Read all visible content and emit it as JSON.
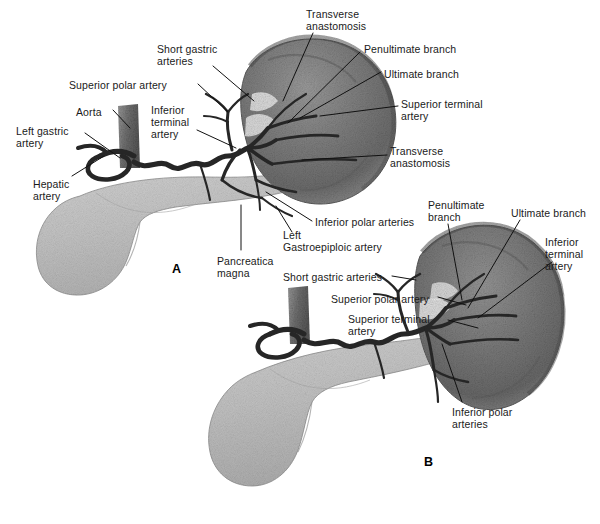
{
  "figure": {
    "background_color": "#ffffff",
    "label_color": "#1a1a1a",
    "organ_colors": {
      "spleen_dark": "#6f6f6f",
      "spleen_mid": "#8a8a8a",
      "spleen_light": "#b4b4b4",
      "pancreas": "#c9c9c9",
      "artery": "#2b2b2b",
      "aorta": "#7a7a7a"
    }
  },
  "panels": [
    {
      "id": "panel-a",
      "label": "A",
      "x": 172,
      "y": 262
    },
    {
      "id": "panel-b",
      "label": "B",
      "x": 424,
      "y": 455
    }
  ],
  "panel_a": {
    "labels": [
      {
        "name": "transverse-anastomosis-upper",
        "text": "Transverse\nanastomosis",
        "x": 306,
        "y": 8,
        "align": "left"
      },
      {
        "name": "penultimate-branch-a",
        "text": "Penultimate branch",
        "x": 364,
        "y": 43,
        "align": "left"
      },
      {
        "name": "ultimate-branch-a",
        "text": "Ultimate branch",
        "x": 384,
        "y": 68,
        "align": "left"
      },
      {
        "name": "superior-terminal-artery-a",
        "text": "Superior terminal\nartery",
        "x": 401,
        "y": 98,
        "align": "left"
      },
      {
        "name": "transverse-anastomosis-lower",
        "text": "Transverse\nanastomosis",
        "x": 390,
        "y": 145,
        "align": "left"
      },
      {
        "name": "short-gastric-arteries-a",
        "text": "Short gastric\narteries",
        "x": 157,
        "y": 43,
        "align": "left"
      },
      {
        "name": "superior-polar-artery-a",
        "text": "Superior polar artery",
        "x": 69,
        "y": 79,
        "align": "left"
      },
      {
        "name": "aorta-a",
        "text": "Aorta",
        "x": 76,
        "y": 106,
        "align": "left"
      },
      {
        "name": "inferior-terminal-artery-a",
        "text": "Inferior\nterminal\nartery",
        "x": 151,
        "y": 104,
        "align": "left"
      },
      {
        "name": "left-gastric-artery-a",
        "text": "Left gastric\nartery",
        "x": 16,
        "y": 125,
        "align": "left"
      },
      {
        "name": "hepatic-artery-a",
        "text": "Hepatic\nartery",
        "x": 33,
        "y": 178,
        "align": "left"
      },
      {
        "name": "pancreatica-magna",
        "text": "Pancreatica\nmagna",
        "x": 217,
        "y": 255,
        "align": "left"
      },
      {
        "name": "inferior-polar-arteries-a",
        "text": "Inferior polar arteries",
        "x": 315,
        "y": 216,
        "align": "left"
      },
      {
        "name": "left-gastroepiploic-artery-a",
        "text": "Left\nGastroepiploic artery",
        "x": 283,
        "y": 229,
        "align": "left"
      }
    ]
  },
  "panel_b": {
    "labels": [
      {
        "name": "penultimate-branch-b",
        "text": "Penultimate\nbranch",
        "x": 428,
        "y": 199,
        "align": "left"
      },
      {
        "name": "ultimate-branch-b",
        "text": "Ultimate branch",
        "x": 511,
        "y": 207,
        "align": "left"
      },
      {
        "name": "inferior-terminal-artery-b",
        "text": "Inferior\nterminal\nartery",
        "x": 545,
        "y": 236,
        "align": "left"
      },
      {
        "name": "short-gastric-arteries-b",
        "text": "Short gastric arteries",
        "x": 283,
        "y": 271,
        "align": "left"
      },
      {
        "name": "superior-polar-artery-b",
        "text": "Superior polar artery",
        "x": 331,
        "y": 293,
        "align": "left"
      },
      {
        "name": "superior-terminal-artery-b",
        "text": "Superior terminal\nartery",
        "x": 348,
        "y": 313,
        "align": "left"
      },
      {
        "name": "inferior-polar-arteries-b",
        "text": "Inferior polar\narteries",
        "x": 452,
        "y": 406,
        "align": "left"
      }
    ]
  }
}
